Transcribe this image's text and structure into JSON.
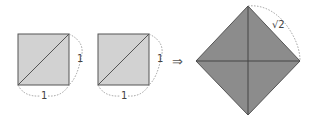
{
  "diagram": {
    "colors": {
      "light_square": "#d2d2d2",
      "dark_square": "#8c8c8c",
      "stroke": "#555555",
      "dash": "#777777"
    },
    "squares": [
      {
        "side_label_right": "1",
        "side_label_bottom": "1"
      },
      {
        "side_label_right": "1",
        "side_label_bottom": "1"
      }
    ],
    "arrow": "⇒",
    "result": {
      "side_label": "√2"
    }
  }
}
